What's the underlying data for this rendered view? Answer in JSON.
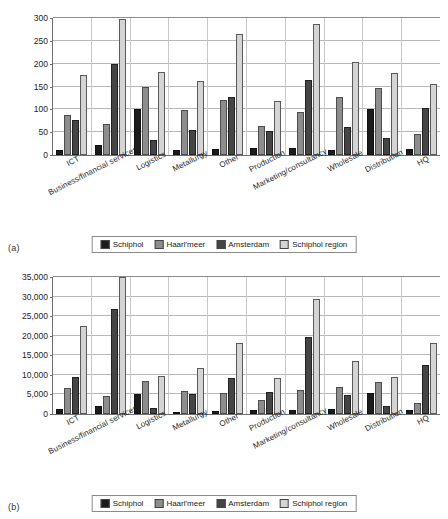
{
  "figures": [
    {
      "panel_label": "(a)",
      "legend": [
        "Schiphol",
        "Haarl'meer",
        "Amsterdam",
        "Schiphol region"
      ]
    },
    {
      "panel_label": "(b)",
      "legend": [
        "Schiphol",
        "Haarl'meer",
        "Amsterdam",
        "Schiphol region"
      ]
    }
  ],
  "chart_data": [
    {
      "type": "bar",
      "panel": "(a)",
      "title": "",
      "xlabel": "",
      "ylabel": "",
      "ylim": [
        0,
        300
      ],
      "yticks": [
        0,
        50,
        100,
        150,
        200,
        250,
        300
      ],
      "ytick_labels": [
        "0",
        "50",
        "100",
        "150",
        "200",
        "250",
        "300"
      ],
      "grid": true,
      "legend_position": "bottom",
      "categories": [
        "ICT",
        "Business/financial services",
        "Logistics",
        "Metallurgy",
        "Other",
        "Production",
        "Marketing/consultancy",
        "Wholesale",
        "Distribution",
        "HQ"
      ],
      "series": [
        {
          "name": "Schiphol",
          "color": "#1b1b1b",
          "values": [
            12,
            22,
            100,
            11,
            14,
            15,
            16,
            11,
            100,
            13
          ]
        },
        {
          "name": "Haarl'meer",
          "color": "#8d8d8d",
          "values": [
            88,
            68,
            150,
            98,
            120,
            64,
            94,
            127,
            146,
            45
          ]
        },
        {
          "name": "Amsterdam",
          "color": "#454545",
          "values": [
            77,
            200,
            32,
            54,
            126,
            52,
            164,
            61,
            37,
            104
          ]
        },
        {
          "name": "Schiphol region",
          "color": "#d4d4d4",
          "values": [
            176,
            297,
            182,
            161,
            265,
            118,
            286,
            204,
            179,
            156
          ]
        }
      ]
    },
    {
      "type": "bar",
      "panel": "(b)",
      "title": "",
      "xlabel": "",
      "ylabel": "",
      "ylim": [
        0,
        35000
      ],
      "yticks": [
        0,
        5000,
        10000,
        15000,
        20000,
        25000,
        30000,
        35000
      ],
      "ytick_labels": [
        "0",
        "5,000",
        "10,000",
        "15,000",
        "20,000",
        "25,000",
        "30,000",
        "35,000"
      ],
      "grid": true,
      "legend_position": "bottom",
      "categories": [
        "ICT",
        "Business/financial services",
        "Logistics",
        "Metallurgy",
        "Other",
        "Production",
        "Marketing/consultancy",
        "Wholesale",
        "Distribution",
        "HQ"
      ],
      "series": [
        {
          "name": "Schiphol",
          "color": "#1b1b1b",
          "values": [
            1400,
            2000,
            5200,
            600,
            650,
            1100,
            900,
            1400,
            5300,
            1100
          ]
        },
        {
          "name": "Haarl'meer",
          "color": "#8d8d8d",
          "values": [
            6600,
            4500,
            8500,
            6000,
            5300,
            3700,
            6200,
            7000,
            8100,
            2900
          ]
        },
        {
          "name": "Amsterdam",
          "color": "#454545",
          "values": [
            9500,
            26800,
            1500,
            5200,
            9200,
            5600,
            19600,
            4900,
            2000,
            12500
          ]
        },
        {
          "name": "Schiphol region",
          "color": "#d4d4d4",
          "values": [
            22400,
            34900,
            9700,
            11800,
            18100,
            9200,
            29400,
            13500,
            9400,
            18100
          ]
        }
      ]
    }
  ]
}
